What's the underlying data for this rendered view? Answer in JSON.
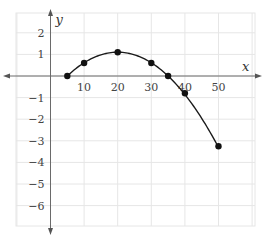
{
  "chart_data": {
    "type": "line",
    "title": "",
    "xlabel": "x",
    "ylabel": "y",
    "xlim": [
      -10,
      60
    ],
    "ylim": [
      -6.8,
      2.9
    ],
    "grid": true,
    "legend": null,
    "x_ticks": [
      10,
      20,
      30,
      40,
      50
    ],
    "y_ticks": [
      2,
      1,
      -1,
      -2,
      -3,
      -4,
      -5,
      -6
    ],
    "x_tick_labels": [
      "10",
      "20",
      "30",
      "40",
      "50"
    ],
    "y_tick_labels": [
      "2",
      "1",
      "−1",
      "−2",
      "−3",
      "−4",
      "−5",
      "−6"
    ],
    "series": [
      {
        "name": "parabola",
        "marker": "circle",
        "line": "smooth",
        "x": [
          5,
          10,
          20,
          30,
          35,
          40,
          50
        ],
        "values": [
          0,
          0.6,
          1.1,
          0.6,
          0,
          -0.8,
          -3.25
        ]
      }
    ],
    "curve_model": {
      "form": "y = a(x - 5)(x - 35)",
      "a": -0.0049,
      "x_from": 5,
      "x_to": 50
    }
  }
}
